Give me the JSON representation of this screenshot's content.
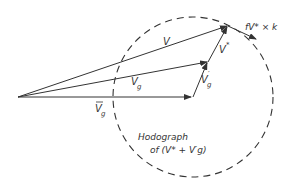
{
  "diagram": {
    "type": "vector-diagram",
    "colors": {
      "stroke": "#333333",
      "background": "#ffffff"
    },
    "points": {
      "origin": [
        18,
        97
      ],
      "vg_bar_tip": [
        192,
        97
      ],
      "vg_tip": [
        208,
        62
      ],
      "v_tip": [
        228,
        26
      ],
      "rot_tip": [
        256,
        39
      ]
    },
    "hodograph_circle": {
      "cx": 193,
      "cy": 97,
      "r": 80,
      "style": "dashed"
    },
    "labels": {
      "v": "V",
      "vg": "V",
      "vg_sub": "g",
      "vg_bar": "V",
      "vg_bar_sub": "g",
      "vg_bar_mark": "̄",
      "vg_prime": "V",
      "vg_prime_sub": "g",
      "vg_prime_mark": "′",
      "v_star": "V",
      "v_star_mark": "*",
      "rotation": "fV* × k",
      "hodograph_line1": "Hodograph",
      "hodograph_line2": "of (V* + V′g)"
    }
  }
}
